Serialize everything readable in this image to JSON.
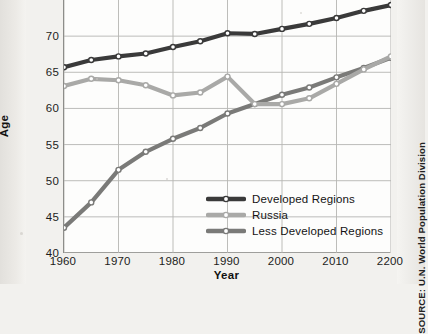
{
  "source_note": "SOURCE: U.N. World Population Division",
  "axis": {
    "ylabel": "Age",
    "xlabel": "Year"
  },
  "legend": {
    "items": [
      {
        "label": "Developed Regions",
        "color": "#3a3a3a"
      },
      {
        "label": "Russia",
        "color": "#a9a9a7"
      },
      {
        "label": "Less Developed Regions",
        "color": "#7a7a78"
      }
    ]
  },
  "chart_data": {
    "type": "line",
    "title": "",
    "xlabel": "Year",
    "ylabel": "Age",
    "x": [
      1960,
      1965,
      1970,
      1975,
      1980,
      1985,
      1990,
      1995,
      2000,
      2005,
      2010,
      2015,
      2020
    ],
    "xtick_labels": [
      "1960",
      "1970",
      "1980",
      "1990",
      "2000",
      "2010",
      "2200"
    ],
    "xtick_values": [
      1960,
      1970,
      1980,
      1990,
      2000,
      2010,
      2020
    ],
    "ytick_labels": [
      "40",
      "45",
      "50",
      "55",
      "60",
      "65",
      "70"
    ],
    "ytick_values": [
      40,
      45,
      50,
      55,
      60,
      65,
      70
    ],
    "xlim": [
      1960,
      2020
    ],
    "ylim": [
      40,
      75
    ],
    "grid": true,
    "legend_position": "inside-lower-right",
    "markers": "open-circle",
    "series": [
      {
        "name": "Developed Regions",
        "color": "#3a3a3a",
        "values": [
          65.7,
          66.7,
          67.2,
          67.6,
          68.5,
          69.3,
          70.4,
          70.3,
          71.0,
          71.7,
          72.5,
          73.5,
          74.3
        ]
      },
      {
        "name": "Russia",
        "color": "#a9a9a7",
        "values": [
          63.1,
          64.1,
          63.9,
          63.2,
          61.8,
          62.2,
          64.4,
          60.6,
          60.6,
          61.4,
          63.4,
          65.4,
          67.2
        ]
      },
      {
        "name": "Less Developed Regions",
        "color": "#7a7a78",
        "values": [
          43.5,
          47.0,
          51.5,
          54.0,
          55.8,
          57.3,
          59.3,
          60.6,
          61.9,
          62.9,
          64.3,
          65.6,
          67.0
        ]
      }
    ]
  }
}
